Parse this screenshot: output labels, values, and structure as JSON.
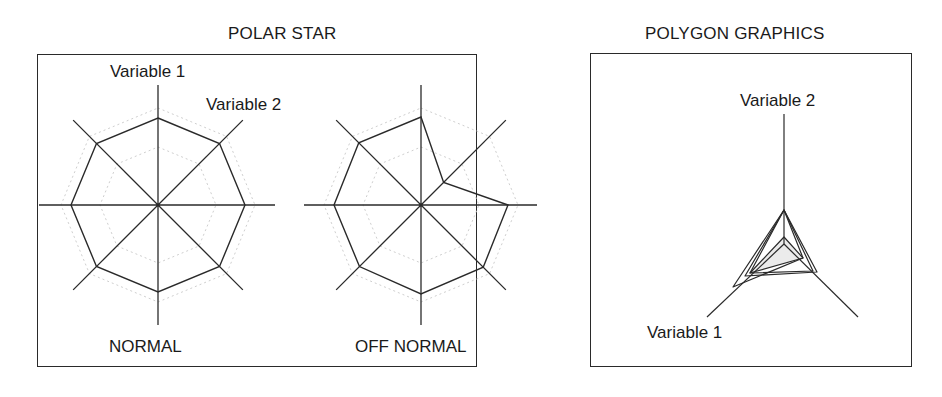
{
  "left_panel": {
    "title": "POLAR STAR",
    "axis_labels": {
      "variable_1": "Variable 1",
      "variable_2": "Variable 2"
    },
    "stars": [
      {
        "caption": "NORMAL",
        "center": [
          158,
          205
        ],
        "values": [
          87,
          87,
          87,
          87,
          87,
          87,
          87,
          87
        ]
      },
      {
        "caption": "OFF NORMAL",
        "center": [
          421,
          205
        ],
        "values": [
          88,
          32,
          87,
          88,
          89,
          87,
          87,
          88
        ]
      }
    ],
    "axis_length": 120,
    "reference_radii": [
      58,
      97
    ]
  },
  "right_panel": {
    "title": "POLYGON GRAPHICS",
    "axis_labels": {
      "variable_1": "Variable 1",
      "variable_2": "Variable 2"
    },
    "center": [
      784,
      244
    ],
    "axes_endpoints": [
      [
        784,
        114
      ],
      [
        707,
        317
      ],
      [
        858,
        317
      ]
    ],
    "polygons": [
      {
        "points": [
          [
            784,
            237
          ],
          [
            750,
            273
          ],
          [
            803,
            258
          ]
        ],
        "fill": "#ebebeb"
      },
      {
        "points": [
          [
            784,
            210
          ],
          [
            750,
            273
          ],
          [
            813,
            271
          ]
        ],
        "fill": "none"
      },
      {
        "points": [
          [
            784,
            210
          ],
          [
            733,
            287
          ],
          [
            803,
            258
          ]
        ],
        "fill": "none"
      },
      {
        "points": [
          [
            784,
            210
          ],
          [
            745,
            276
          ],
          [
            817,
            272
          ]
        ],
        "fill": "none"
      }
    ]
  },
  "colors": {
    "stroke": "#2a2a2a",
    "reference": "#cfcfcf",
    "shade": "#ebebeb"
  }
}
